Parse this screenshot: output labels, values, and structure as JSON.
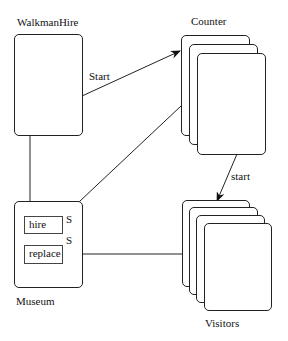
{
  "diagram": {
    "components": [
      {
        "id": "walkmanhire",
        "label": "WalkmanHire",
        "instances": 1
      },
      {
        "id": "counter",
        "label": "Counter",
        "instances": 3
      },
      {
        "id": "museum",
        "label": "Museum",
        "instances": 1,
        "ports": [
          {
            "label": "hire",
            "marker": "S"
          },
          {
            "label": "replace",
            "marker": "S"
          }
        ]
      },
      {
        "id": "visitors",
        "label": "Visitors",
        "instances": 4
      }
    ],
    "connections": [
      {
        "from": "walkmanhire",
        "to": "counter",
        "label": "Start"
      },
      {
        "from": "walkmanhire",
        "to": "museum",
        "label": ""
      },
      {
        "from": "counter",
        "to": "museum.hire",
        "label": ""
      },
      {
        "from": "counter",
        "to": "visitors",
        "label": "start"
      },
      {
        "from": "visitors",
        "to": "museum.replace",
        "label": ""
      }
    ]
  }
}
